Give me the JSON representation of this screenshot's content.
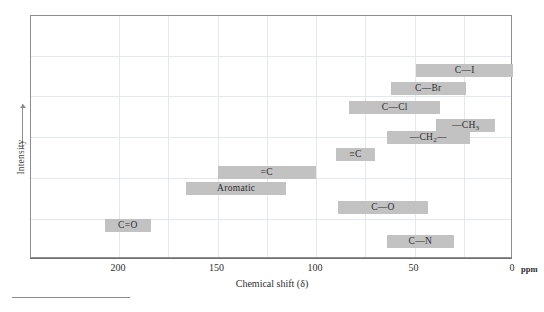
{
  "chart_data": {
    "type": "bar",
    "orientation": "horizontal-ranges",
    "title": "",
    "xlabel": "Chemical shift (δ)",
    "ylabel": "Intensity",
    "xunit": "ppm",
    "xlim": [
      215,
      0
    ],
    "x_reversed": true,
    "xticks": [
      200,
      150,
      100,
      50,
      0
    ],
    "xticklabels": [
      "200",
      "150",
      "100",
      "50",
      "0"
    ],
    "grid": true,
    "legend": false,
    "bar_color": "#c2c2c2",
    "ranges": [
      {
        "label": "C—I",
        "start": 49,
        "end": 0,
        "row": 0
      },
      {
        "label": "C—Br",
        "start": 62,
        "end": 24,
        "row": 1
      },
      {
        "label": "C—Cl",
        "start": 83,
        "end": 37,
        "row": 2
      },
      {
        "label": "—CH3",
        "start": 39,
        "end": 9,
        "row": 3
      },
      {
        "label": "—CH2—",
        "start": 64,
        "end": 22,
        "row": 4
      },
      {
        "label": "≡C",
        "start": 90,
        "end": 70,
        "row": 5
      },
      {
        "label": "=C",
        "start": 150,
        "end": 100,
        "row": 6
      },
      {
        "label": "Aromatic",
        "start": 166,
        "end": 115,
        "row": 7
      },
      {
        "label": "C—O",
        "start": 89,
        "end": 43,
        "row": 8
      },
      {
        "label": "C=O",
        "start": 207,
        "end": 184,
        "row": 9
      },
      {
        "label": "C—N",
        "start": 64,
        "end": 30,
        "row": 10
      }
    ]
  },
  "axes": {
    "xlabel": "Chemical shift (δ)",
    "ylabel": "Intensity",
    "ppm_unit": "ppm",
    "xticklabels": [
      "200",
      "150",
      "100",
      "50",
      "0"
    ]
  },
  "bars": [
    {
      "label_html": "C—I",
      "name": "bar-c-i"
    },
    {
      "label_html": "C—Br",
      "name": "bar-c-br"
    },
    {
      "label_html": "C—Cl",
      "name": "bar-c-cl"
    },
    {
      "label_html": "—CH<sub>3</sub>",
      "name": "bar-ch3"
    },
    {
      "label_html": "—CH<sub>2</sub>—",
      "name": "bar-ch2"
    },
    {
      "label_html": "≡C",
      "name": "bar-triple-c"
    },
    {
      "label_html": "=C",
      "name": "bar-double-c"
    },
    {
      "label_html": "Aromatic",
      "name": "bar-aromatic"
    },
    {
      "label_html": "C—O",
      "name": "bar-c-o"
    },
    {
      "label_html": "C=O",
      "name": "bar-c-double-o"
    },
    {
      "label_html": "C—N",
      "name": "bar-c-n"
    }
  ]
}
